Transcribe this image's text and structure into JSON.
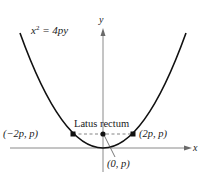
{
  "diagram": {
    "equation": {
      "base": "x",
      "exponent": "2",
      "rest": " = 4py"
    },
    "axes": {
      "x_label": "x",
      "y_label": "y"
    },
    "latus_rectum_label": "Latus rectum",
    "points": {
      "left": "(−2p, p)",
      "right": "(2p, p)",
      "focus": "(0, p)"
    },
    "colors": {
      "curve": "#111111",
      "axis": "#8a8a8a",
      "dash": "#777777",
      "point": "#111111"
    }
  }
}
